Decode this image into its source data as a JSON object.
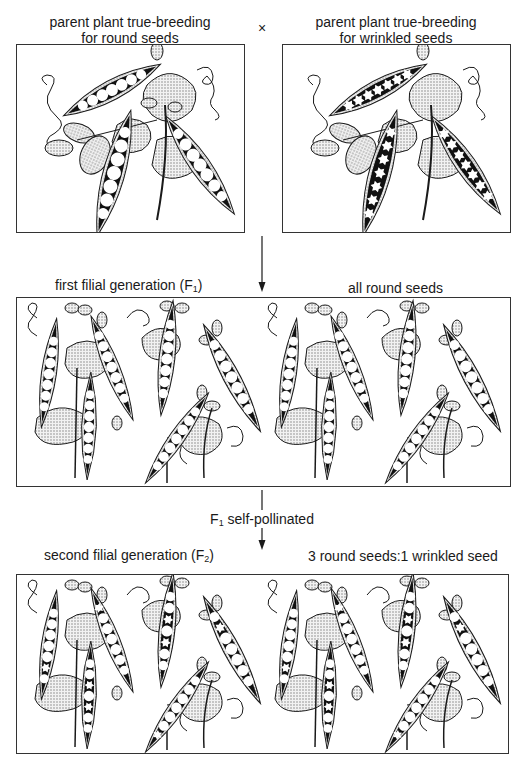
{
  "diagram": {
    "type": "mendelian-monohybrid-cross",
    "parents": {
      "left": {
        "label_line1": "parent plant true-breeding",
        "label_line2": "for round seeds",
        "seed_type": "round",
        "pods": 3,
        "seeds_per_pod": [
          7,
          7,
          7
        ]
      },
      "cross_symbol": "×",
      "right": {
        "label_line1": "parent plant true-breeding",
        "label_line2": "for wrinkled seeds",
        "seed_type": "wrinkled",
        "pods": 3,
        "seeds_per_pod": [
          7,
          7,
          7
        ]
      }
    },
    "f1": {
      "title_prefix": "first filial generation (F",
      "title_sub": "1",
      "title_suffix": ")",
      "result": "all round seeds",
      "pods": 10,
      "seed_type": "round"
    },
    "step": {
      "prefix": "F",
      "sub": "1",
      "suffix": " self-pollinated"
    },
    "f2": {
      "title_prefix": "second filial generation (F",
      "title_sub": "2",
      "title_suffix": ")",
      "result": "3 round seeds:1 wrinkled seed",
      "pods": 10,
      "seed_type": "mixed"
    },
    "colors": {
      "line": "#1a1a1a",
      "pod_interior": "#111111",
      "seed": "#ffffff",
      "leaf_fill": "#d9d9d9",
      "border": "#333333"
    }
  }
}
